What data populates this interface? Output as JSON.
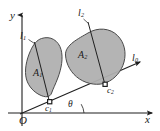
{
  "figure": {
    "type": "geometry-diagram",
    "background_color": "#ffffff",
    "stroke_color": "#1f1f1f",
    "region_fill_color": "#b3b3b3",
    "region_stroke_color": "#4d4d4d",
    "axes": {
      "x_label": "x",
      "y_label": "y",
      "origin_label": "O"
    },
    "lines": [
      {
        "name": "l1",
        "label_main": "l",
        "label_sub": "1"
      },
      {
        "name": "l2",
        "label_main": "l",
        "label_sub": "2"
      },
      {
        "name": "l0",
        "label_main": "l",
        "label_sub": "0"
      }
    ],
    "regions": [
      {
        "name": "A1",
        "label_main": "A",
        "label_sub": "1"
      },
      {
        "name": "A2",
        "label_main": "A",
        "label_sub": "2"
      }
    ],
    "points": [
      {
        "name": "c1",
        "label_main": "c",
        "label_sub": "1"
      },
      {
        "name": "c2",
        "label_main": "c",
        "label_sub": "2"
      }
    ],
    "angle": {
      "label": "θ"
    }
  }
}
